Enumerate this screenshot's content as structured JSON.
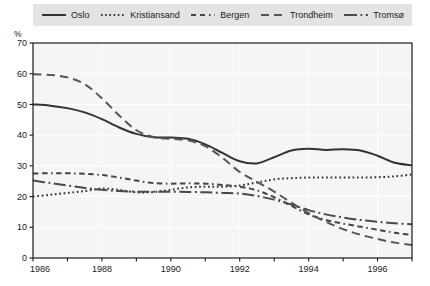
{
  "chart_data": {
    "type": "line",
    "title": "",
    "subtitle": "",
    "xlabel": "",
    "ylabel": "%",
    "unit_label": "%",
    "xlim": [
      1986,
      1997
    ],
    "ylim": [
      0,
      70
    ],
    "yticks": [
      0,
      10,
      20,
      30,
      40,
      50,
      60,
      70
    ],
    "xticks": [
      1986,
      1988,
      1990,
      1992,
      1994,
      1996
    ],
    "xticks_minor": [
      1987,
      1989,
      1991,
      1993,
      1995,
      1997
    ],
    "grid": true,
    "legend_position": "top",
    "x": [
      1986,
      1986.5,
      1987,
      1987.5,
      1988,
      1988.5,
      1989,
      1989.5,
      1990,
      1990.5,
      1991,
      1991.5,
      1992,
      1992.5,
      1993,
      1993.5,
      1994,
      1994.5,
      1995,
      1995.5,
      1996,
      1996.5,
      1997
    ],
    "series": [
      {
        "name": "Oslo",
        "style": "solid",
        "color": "#333333",
        "values": [
          50.0,
          49.6,
          48.8,
          47.4,
          45.2,
          42.5,
          40.4,
          39.3,
          39.2,
          38.8,
          37.0,
          34.2,
          31.5,
          30.8,
          32.8,
          35.0,
          35.6,
          35.2,
          35.4,
          35.0,
          33.3,
          31.0,
          30.2
        ]
      },
      {
        "name": "Kristiansand",
        "style": "dotted",
        "color": "#333333",
        "values": [
          20.0,
          20.6,
          21.2,
          21.8,
          22.6,
          22.2,
          21.4,
          21.5,
          22.2,
          23.0,
          23.2,
          23.2,
          23.6,
          24.6,
          25.6,
          26.0,
          26.2,
          26.2,
          26.2,
          26.2,
          26.3,
          26.6,
          27.2
        ]
      },
      {
        "name": "Bergen",
        "style": "dashed-short",
        "color": "#444444",
        "values": [
          27.5,
          27.6,
          27.6,
          27.4,
          27.0,
          26.2,
          25.2,
          24.4,
          24.2,
          24.3,
          24.2,
          23.8,
          23.2,
          22.0,
          19.8,
          17.0,
          14.2,
          12.4,
          11.2,
          10.2,
          9.2,
          8.2,
          7.5
        ]
      },
      {
        "name": "Trondheim",
        "style": "dashed-long",
        "color": "#555555",
        "values": [
          59.8,
          59.6,
          58.8,
          56.6,
          52.0,
          46.4,
          41.6,
          39.4,
          38.8,
          38.3,
          36.4,
          32.6,
          28.0,
          24.8,
          21.6,
          18.0,
          14.6,
          11.8,
          9.4,
          7.6,
          6.2,
          5.0,
          4.2
        ]
      },
      {
        "name": "Tromsø",
        "style": "dash-dot",
        "color": "#4a4a4a",
        "values": [
          25.2,
          24.4,
          23.6,
          22.8,
          22.2,
          21.8,
          21.6,
          21.6,
          21.6,
          21.5,
          21.4,
          21.2,
          21.0,
          20.2,
          19.0,
          17.4,
          15.6,
          14.2,
          13.2,
          12.4,
          11.8,
          11.3,
          11.0
        ]
      }
    ]
  },
  "legend": {
    "items": [
      {
        "label": "Oslo",
        "key": "line-key-solid"
      },
      {
        "label": "Kristiansand",
        "key": "line-key-dotted"
      },
      {
        "label": "Bergen",
        "key": "line-key-dashed-short"
      },
      {
        "label": "Trondheim",
        "key": "line-key-dashed-long"
      },
      {
        "label": "Tromsø",
        "key": "line-key-dash-dot"
      }
    ]
  },
  "axes": {
    "y_tick_labels": [
      "70",
      "60",
      "50",
      "40",
      "30",
      "20",
      "10",
      "0"
    ],
    "x_tick_labels": [
      "1986",
      "1988",
      "1990",
      "1992",
      "1994",
      "1996"
    ]
  },
  "colors": {
    "legend_background": "#e3e3e3",
    "plot_background": "#f5f5f5",
    "axis": "#1a1a1a",
    "grid": "#ffffff",
    "text": "#1a1a1a"
  }
}
